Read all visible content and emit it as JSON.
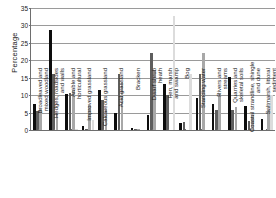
{
  "chart_data": {
    "type": "bar",
    "title": "",
    "xlabel": "",
    "ylabel": "Percentage",
    "ylim": [
      0,
      35
    ],
    "yticks": [
      0,
      5,
      10,
      15,
      20,
      25,
      30,
      35
    ],
    "grid": true,
    "legend": "none",
    "categories": [
      "Broadleaved and mixed woodland",
      "Hedges, roadsides and walls",
      "Arable and horticultural",
      "Improved grassland",
      "Calcareous grassland",
      "Acid grassland",
      "Bracken",
      "Dwarf shrub heath",
      "Fen, marsh and swamp",
      "Bog",
      "Standing water",
      "Rivers and streams",
      "Quarries and skeletal soils",
      "Coastal strandline, shingle and dune",
      "Saltmarsh, littoral sediment"
    ],
    "series": [
      {
        "name": "series-1",
        "color": "#0d0d0d",
        "values": [
          7.6,
          28.6,
          10.3,
          1.1,
          11.4,
          4.8,
          0.5,
          4.3,
          13.2,
          2.0,
          9.1,
          7.6,
          15.1,
          7.0,
          3.3
        ]
      },
      {
        "name": "series-2",
        "color": "#5e5e5e",
        "values": [
          5.5,
          16.1,
          10.7,
          0.4,
          8.6,
          16.0,
          0.3,
          22.0,
          10.0,
          2.4,
          16.0,
          5.8,
          5.7,
          2.6,
          0.0
        ]
      },
      {
        "name": "series-3",
        "color": "#a8a8a8",
        "values": [
          6.1,
          4.7,
          11.5,
          7.2,
          6.0,
          13.8,
          0.2,
          17.1,
          0.0,
          0.0,
          22.0,
          10.3,
          6.7,
          4.4,
          5.8
        ]
      },
      {
        "name": "series-4",
        "color": "#dcdcdc",
        "values": [
          0.0,
          0.0,
          0.4,
          3.0,
          0.0,
          0.0,
          0.0,
          0.0,
          32.8,
          16.1,
          0.0,
          0.0,
          0.0,
          0.0,
          10.1
        ]
      }
    ]
  }
}
